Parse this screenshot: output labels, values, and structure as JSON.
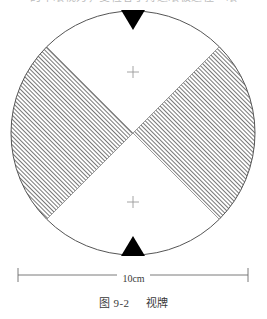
{
  "page": {
    "width_px": 267,
    "height_px": 319,
    "background_color": "#ffffff",
    "ink_color": "#2b2b2b"
  },
  "top_cropped_text": {
    "text": "的单眼视力，受检者手持遮眼板遮住一眼",
    "note": "clipped at top edge of page"
  },
  "figure": {
    "caption_number": "图 9-2",
    "caption_title": "视牌",
    "diagram": {
      "type": "hatched-quadrant-disc",
      "center_x": 133,
      "center_y": 127,
      "radius": 122,
      "outline_color": "#555555",
      "hatch_color": "#4a4a4a",
      "fill_color": "#ffffff",
      "marker_color": "#000000",
      "sectors": [
        {
          "name": "top-sector",
          "start_deg": -135,
          "end_deg": -45,
          "fill": "white"
        },
        {
          "name": "right-sector",
          "start_deg": -45,
          "end_deg": 45,
          "fill": "hatched"
        },
        {
          "name": "bottom-sector",
          "start_deg": 45,
          "end_deg": 135,
          "fill": "white"
        },
        {
          "name": "left-sector",
          "start_deg": 135,
          "end_deg": 225,
          "fill": "hatched"
        }
      ],
      "center_marks": [
        {
          "name": "upper-cross-mark",
          "glyph": "+",
          "x": 133,
          "y": 66
        },
        {
          "name": "lower-cross-mark",
          "glyph": "+",
          "x": 133,
          "y": 196
        }
      ],
      "markers": [
        {
          "name": "top-marker-triangle",
          "shape": "triangle-down",
          "x": 133,
          "y": 5
        },
        {
          "name": "bottom-marker-triangle",
          "shape": "triangle-up",
          "x": 133,
          "y": 249
        }
      ]
    },
    "dimension": {
      "label": "10cm",
      "line_y": 13,
      "left_tick_x": 18,
      "right_tick_x": 248,
      "tick_half_height": 7
    }
  }
}
